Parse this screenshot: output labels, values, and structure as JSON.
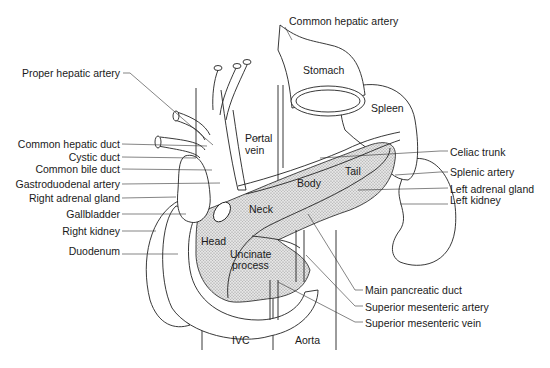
{
  "diagram": {
    "type": "anatomical illustration",
    "labels_left": {
      "proper_hepatic_artery": "Proper hepatic artery",
      "common_hepatic_duct": "Common hepatic duct",
      "cystic_duct": "Cystic duct",
      "common_bile_duct": "Common bile duct",
      "gastroduodenal_artery": "Gastroduodenal artery",
      "right_adrenal_gland": "Right adrenal gland",
      "gallbladder": "Gallbladder",
      "right_kidney": "Right kidney",
      "duodenum": "Duodenum"
    },
    "labels_right": {
      "common_hepatic_artery": "Common hepatic artery",
      "celiac_trunk": "Celiac trunk",
      "splenic_artery": "Splenic artery",
      "left_adrenal_gland": "Left adrenal gland",
      "left_kidney": "Left kidney",
      "main_pancreatic_duct": "Main pancreatic duct",
      "superior_mesenteric_artery": "Superior mesenteric artery",
      "superior_mesenteric_vein": "Superior mesenteric vein"
    },
    "labels_inline": {
      "stomach": "Stomach",
      "spleen": "Spleen",
      "portal_vein_1": "Portal",
      "portal_vein_2": "vein",
      "tail": "Tail",
      "body": "Body",
      "neck": "Neck",
      "head": "Head",
      "uncinate_1": "Uncinate",
      "uncinate_2": "process",
      "ivc": "IVC",
      "aorta": "Aorta"
    }
  }
}
